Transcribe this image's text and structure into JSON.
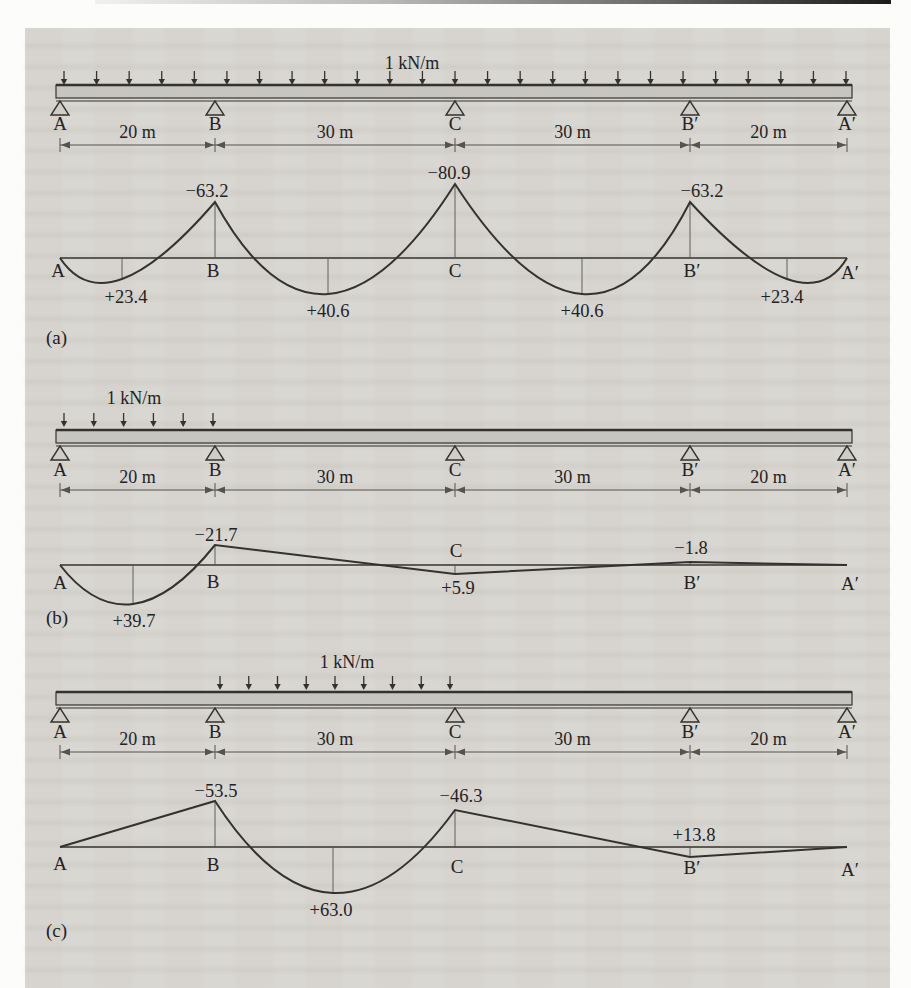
{
  "page": {
    "figure_captions": [
      "(a)",
      "(b)",
      "(c)"
    ]
  },
  "figures": [
    {
      "id": "a",
      "caption": "(a)",
      "load_label": "1 kN/m",
      "load_extent": "uniform load over entire beam A to A′",
      "supports": [
        "A",
        "B",
        "C",
        "B′",
        "A′"
      ],
      "span_labels": [
        "20 m",
        "30 m",
        "30 m",
        "20 m"
      ],
      "moments": [
        {
          "at": "support B",
          "display": "−63.2",
          "value": -63.2
        },
        {
          "at": "support C",
          "display": "−80.9",
          "value": -80.9
        },
        {
          "at": "support B′",
          "display": "−63.2",
          "value": -63.2
        },
        {
          "at": "span A–B",
          "display": "+23.4",
          "value": 23.4
        },
        {
          "at": "span B–C",
          "display": "+40.6",
          "value": 40.6
        },
        {
          "at": "span C–B′",
          "display": "+40.6",
          "value": 40.6
        },
        {
          "at": "span B′–A′",
          "display": "+23.4",
          "value": 23.4
        }
      ]
    },
    {
      "id": "b",
      "caption": "(b)",
      "load_label": "1 kN/m",
      "load_extent": "uniform load on span A–B only",
      "supports": [
        "A",
        "B",
        "C",
        "B′",
        "A′"
      ],
      "span_labels": [
        "20 m",
        "30 m",
        "30 m",
        "20 m"
      ],
      "moments": [
        {
          "at": "support B",
          "display": "−21.7",
          "value": -21.7
        },
        {
          "at": "span A–B",
          "display": "+39.7",
          "value": 39.7
        },
        {
          "at": "support C",
          "display": "+5.9",
          "value": 5.9
        },
        {
          "at": "support B′",
          "display": "−1.8",
          "value": -1.8
        }
      ]
    },
    {
      "id": "c",
      "caption": "(c)",
      "load_label": "1 kN/m",
      "load_extent": "uniform load on span B–C only",
      "supports": [
        "A",
        "B",
        "C",
        "B′",
        "A′"
      ],
      "span_labels": [
        "20 m",
        "30 m",
        "30 m",
        "20 m"
      ],
      "moments": [
        {
          "at": "support B",
          "display": "−53.5",
          "value": -53.5
        },
        {
          "at": "span B–C",
          "display": "+63.0",
          "value": 63.0
        },
        {
          "at": "support C",
          "display": "−46.3",
          "value": -46.3
        },
        {
          "at": "support B′",
          "display": "+13.8",
          "value": 13.8
        }
      ]
    }
  ],
  "chart_data": [
    {
      "type": "line",
      "title": "Bending moment diagram (a): 1 kN/m over full beam",
      "supports": [
        "A",
        "B",
        "C",
        "B′",
        "A′"
      ],
      "support_positions_m": [
        0,
        20,
        50,
        80,
        100
      ],
      "span_lengths_m": [
        20,
        30,
        30,
        20
      ],
      "support_moments": [
        0,
        -63.2,
        -80.9,
        -63.2,
        0
      ],
      "span_peak_moments": [
        23.4,
        40.6,
        40.6,
        23.4
      ],
      "sign_convention": "negative moments plotted above baseline"
    },
    {
      "type": "line",
      "title": "Bending moment diagram (b): 1 kN/m on span A–B only",
      "supports": [
        "A",
        "B",
        "C",
        "B′",
        "A′"
      ],
      "support_positions_m": [
        0,
        20,
        50,
        80,
        100
      ],
      "span_lengths_m": [
        20,
        30,
        30,
        20
      ],
      "support_moments": [
        0,
        -21.7,
        5.9,
        -1.8,
        0
      ],
      "span_peak_moments": [
        39.7,
        null,
        null,
        null
      ],
      "sign_convention": "negative moments plotted above baseline"
    },
    {
      "type": "line",
      "title": "Bending moment diagram (c): 1 kN/m on span B–C only",
      "supports": [
        "A",
        "B",
        "C",
        "B′",
        "A′"
      ],
      "support_positions_m": [
        0,
        20,
        50,
        80,
        100
      ],
      "span_lengths_m": [
        20,
        30,
        30,
        20
      ],
      "support_moments": [
        0,
        -53.5,
        -46.3,
        13.8,
        0
      ],
      "span_peak_moments": [
        null,
        63.0,
        null,
        null
      ],
      "sign_convention": "negative moments plotted above baseline"
    }
  ]
}
